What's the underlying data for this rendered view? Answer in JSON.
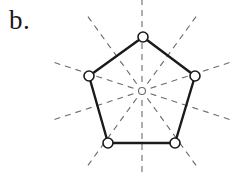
{
  "figure": {
    "panel_label": "b.",
    "caption_label_position": "top-left",
    "background_color": "#ffffff",
    "stroke_color": "#1a1a1a",
    "dashed_stroke_color": "#6b6b6b",
    "vertex_fill_color": "#ffffff"
  },
  "chart_data": {
    "type": "diagram",
    "title": "b.",
    "subtitle": "",
    "xlabel": "",
    "ylabel": "",
    "shape": "regular-pentagon",
    "symmetry_group": "D5",
    "axis_count": 10,
    "grid": false,
    "legend": null,
    "canvas": {
      "width": 230,
      "height": 177
    },
    "center": {
      "x": 142,
      "y": 91,
      "marker": "small-open-circle",
      "radius": 3.5
    },
    "circumradius": 56,
    "vertices": [
      {
        "id": "v1",
        "label": "top",
        "x": 143,
        "y": 37,
        "angle_deg": 90
      },
      {
        "id": "v2",
        "label": "right",
        "x": 195,
        "y": 76,
        "angle_deg": 18
      },
      {
        "id": "v3",
        "label": "bottom-right",
        "x": 175,
        "y": 143,
        "angle_deg": -54
      },
      {
        "id": "v4",
        "label": "bottom-left",
        "x": 108,
        "y": 143,
        "angle_deg": -126
      },
      {
        "id": "v5",
        "label": "left",
        "x": 89,
        "y": 76,
        "angle_deg": 162
      }
    ],
    "edges": [
      {
        "from": "v1",
        "to": "v2"
      },
      {
        "from": "v2",
        "to": "v3"
      },
      {
        "from": "v3",
        "to": "v4"
      },
      {
        "from": "v4",
        "to": "v5"
      },
      {
        "from": "v5",
        "to": "v1"
      }
    ],
    "edge_midpoints": [
      {
        "id": "m1",
        "between": [
          "v1",
          "v2"
        ],
        "x": 169,
        "y": 56.5
      },
      {
        "id": "m2",
        "between": [
          "v2",
          "v3"
        ],
        "x": 185,
        "y": 109.5
      },
      {
        "id": "m3",
        "between": [
          "v3",
          "v4"
        ],
        "x": 141.5,
        "y": 143
      },
      {
        "id": "m4",
        "between": [
          "v4",
          "v5"
        ],
        "x": 98.5,
        "y": 109.5
      },
      {
        "id": "m5",
        "between": [
          "v5",
          "v1"
        ],
        "x": 116,
        "y": 56.5
      }
    ],
    "symmetry_axes": [
      {
        "id": "axis-vertex-1",
        "through": "v1",
        "angle_deg": 90,
        "kind": "vertex"
      },
      {
        "id": "axis-vertex-2",
        "through": "v2",
        "angle_deg": 18,
        "kind": "vertex"
      },
      {
        "id": "axis-vertex-3",
        "through": "v3",
        "angle_deg": -54,
        "kind": "vertex"
      },
      {
        "id": "axis-vertex-4",
        "through": "v4",
        "angle_deg": -126,
        "kind": "vertex"
      },
      {
        "id": "axis-vertex-5",
        "through": "v5",
        "angle_deg": 162,
        "kind": "vertex"
      },
      {
        "id": "axis-edge-1",
        "through": "m1",
        "angle_deg": 54,
        "kind": "edge-midpoint"
      },
      {
        "id": "axis-edge-2",
        "through": "m2",
        "angle_deg": -18,
        "kind": "edge-midpoint"
      },
      {
        "id": "axis-edge-3",
        "through": "m3",
        "angle_deg": -90,
        "kind": "edge-midpoint"
      },
      {
        "id": "axis-edge-4",
        "through": "m4",
        "angle_deg": -162,
        "kind": "edge-midpoint"
      },
      {
        "id": "axis-edge-5",
        "through": "m5",
        "angle_deg": 126,
        "kind": "edge-midpoint"
      }
    ],
    "style": {
      "edge_stroke_width": 2.4,
      "axis_stroke_width": 1.1,
      "axis_dash_pattern": "6 5",
      "axis_inner_gap": 9,
      "axis_outer_length": 92,
      "vertex_marker_radius": 5,
      "vertex_marker_stroke_width": 1.6
    }
  }
}
